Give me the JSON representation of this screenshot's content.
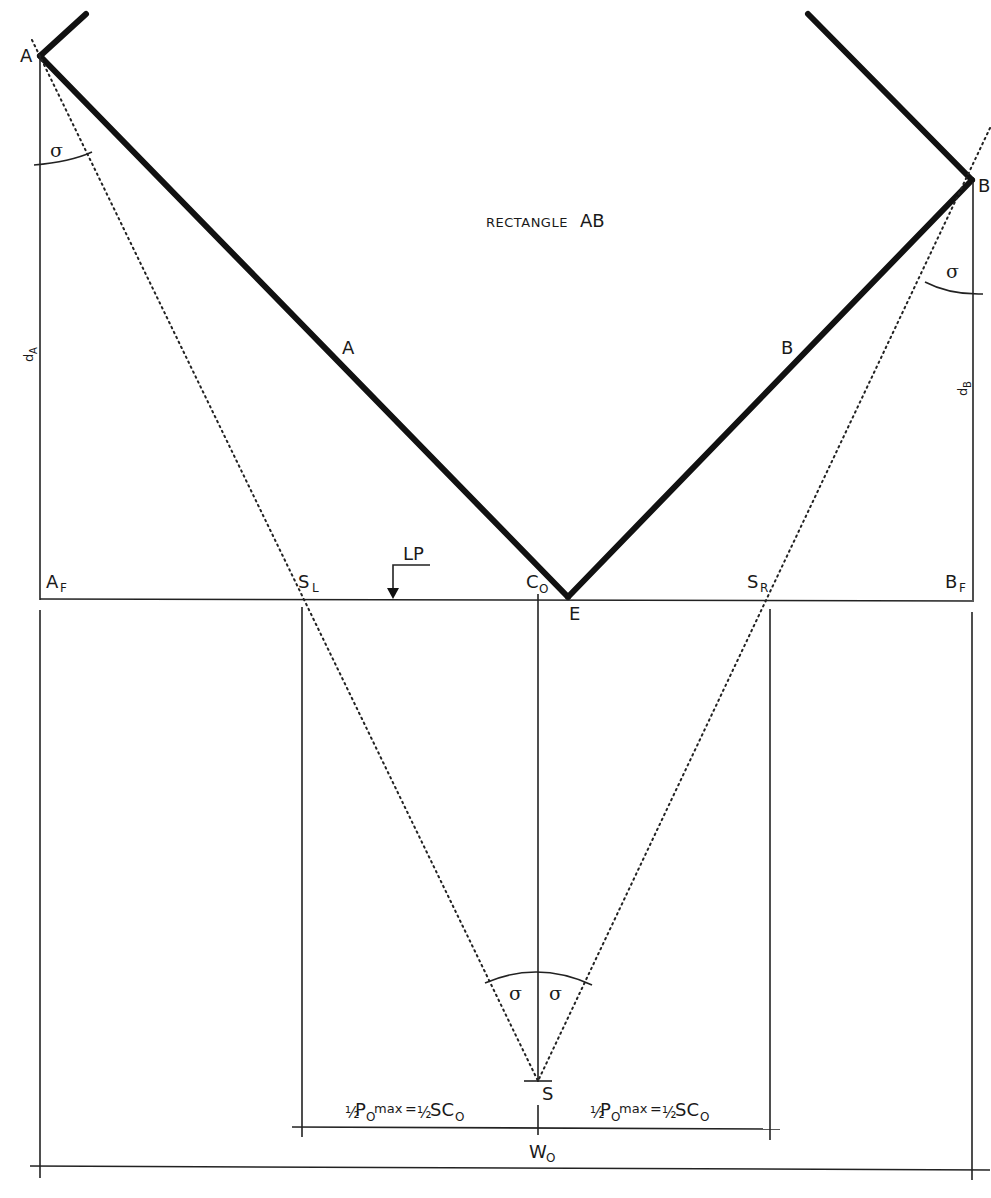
{
  "title": "RECTANGLE AB",
  "labels": {
    "rect_title_prefix": "RECTANGLE",
    "rect_title_suffix": "AB",
    "point_A": "A",
    "point_B": "B",
    "line_A": "A",
    "line_B": "B",
    "dA_main": "d",
    "dA_sub": "A",
    "dB_main": "d",
    "dB_sub": "B",
    "AF_main": "A",
    "AF_sub": "F",
    "BF_main": "B",
    "BF_sub": "F",
    "SL_main": "S",
    "SL_sub": "L",
    "SR_main": "S",
    "SR_sub": "R",
    "C0_main": "C",
    "C0_sub": "O",
    "E": "E",
    "LP": "LP",
    "S": "S",
    "W0_main": "W",
    "W0_sub": "O",
    "sigma": "σ"
  },
  "formula_left": {
    "half": "½",
    "p": "P",
    "p_sub": "O",
    "max": "max",
    "eq": "=",
    "half2": "½",
    "sc": "SC",
    "sc_sub": "O"
  },
  "formula_right": {
    "half": "½",
    "p": "P",
    "p_sub": "O",
    "max": "max",
    "eq": "=",
    "half2": "½",
    "sc": "SC",
    "sc_sub": "O"
  },
  "colors": {
    "ink": "#1a1a1a",
    "background": "#ffffff"
  }
}
